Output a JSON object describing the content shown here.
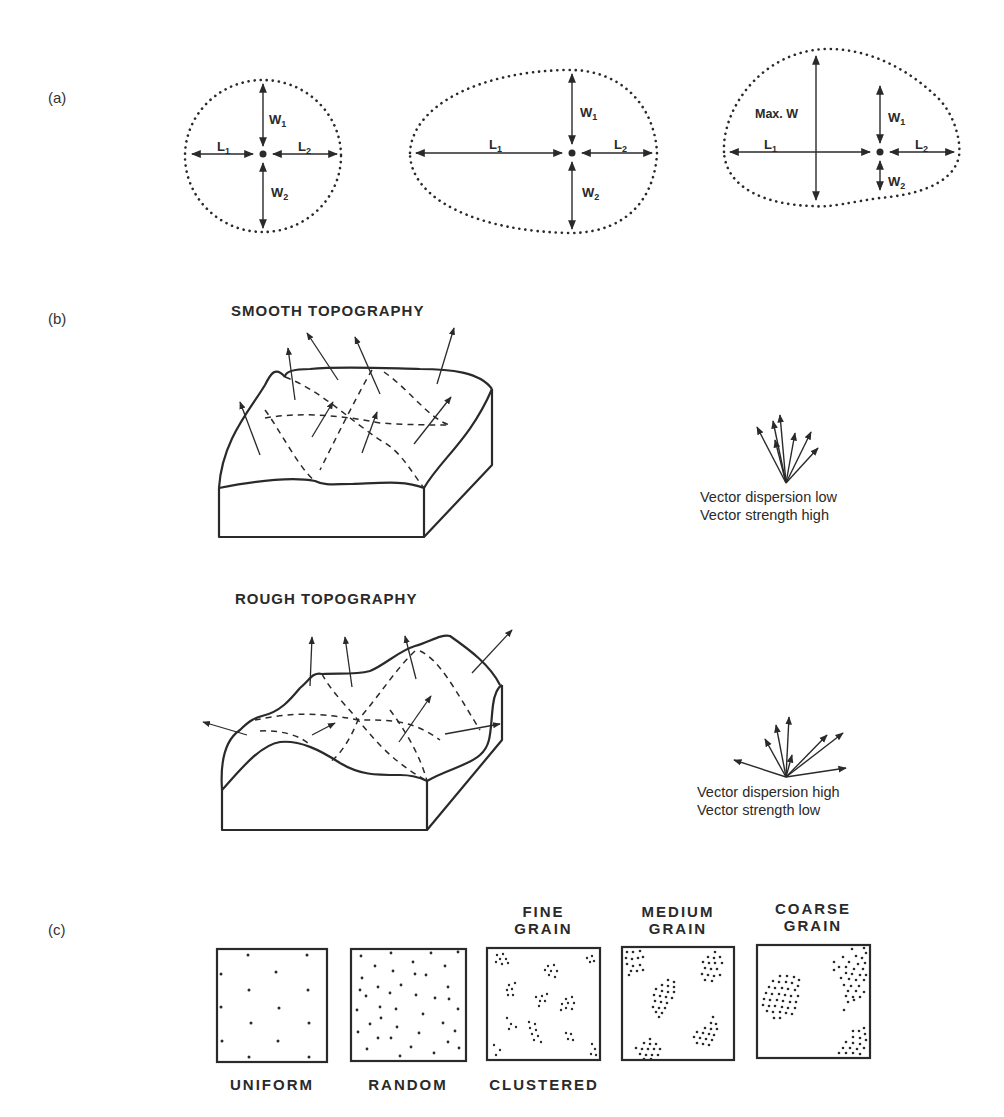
{
  "panels": {
    "a": {
      "label": "(a)",
      "shapes": [
        {
          "name": "round",
          "labels": {
            "w1": "W",
            "w1_sub": "1",
            "w2": "W",
            "w2_sub": "2",
            "l1": "L",
            "l1_sub": "1",
            "l2": "L",
            "l2_sub": "2"
          }
        },
        {
          "name": "elongated",
          "labels": {
            "w1": "W",
            "w1_sub": "1",
            "w2": "W",
            "w2_sub": "2",
            "l1": "L",
            "l1_sub": "1",
            "l2": "L",
            "l2_sub": "2"
          }
        },
        {
          "name": "irregular",
          "labels": {
            "maxw": "Max. W",
            "w1": "W",
            "w1_sub": "1",
            "w2": "W",
            "w2_sub": "2",
            "l1": "L",
            "l1_sub": "1",
            "l2": "L",
            "l2_sub": "2"
          }
        }
      ]
    },
    "b": {
      "label": "(b)",
      "smooth": {
        "title": "SMOOTH TOPOGRAPHY",
        "caption_line1": "Vector dispersion low",
        "caption_line2": "Vector strength high"
      },
      "rough": {
        "title": "ROUGH TOPOGRAPHY",
        "caption_line1": "Vector dispersion high",
        "caption_line2": "Vector strength low"
      }
    },
    "c": {
      "label": "(c)",
      "boxes": [
        {
          "top_label": "",
          "bottom_label": "UNIFORM"
        },
        {
          "top_label": "",
          "bottom_label": "RANDOM"
        },
        {
          "top_label_line1": "FINE",
          "top_label_line2": "GRAIN",
          "bottom_label": "CLUSTERED"
        },
        {
          "top_label_line1": "MEDIUM",
          "top_label_line2": "GRAIN",
          "bottom_label": ""
        },
        {
          "top_label_line1": "COARSE",
          "top_label_line2": "GRAIN",
          "bottom_label": ""
        }
      ]
    }
  },
  "colors": {
    "ink": "#2a2a2a",
    "background": "#ffffff"
  }
}
